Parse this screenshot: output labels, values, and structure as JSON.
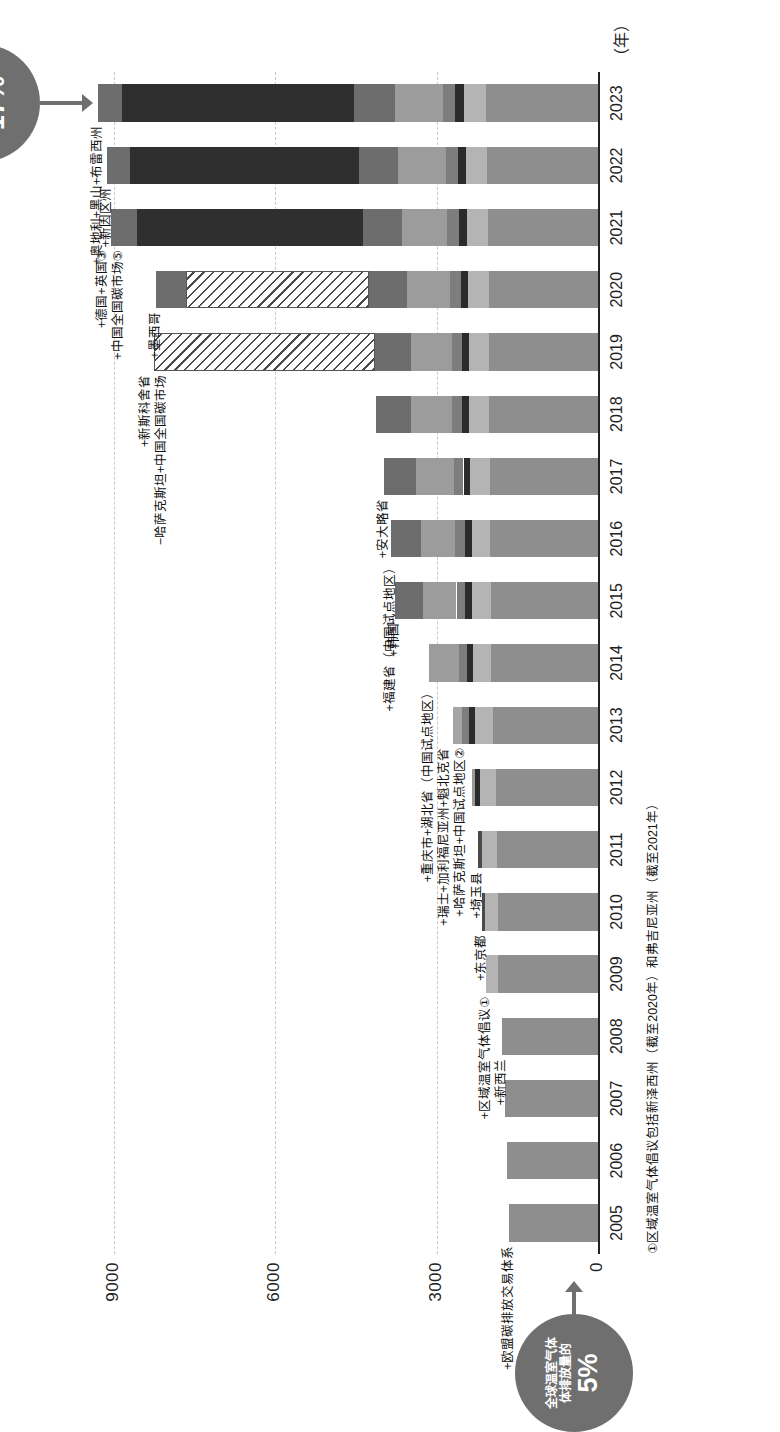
{
  "chart_data": {
    "type": "bar",
    "title": "",
    "xlabel": "（年）",
    "ylabel": "",
    "ylim": [
      0,
      10000
    ],
    "yticks": [
      "0",
      "3000",
      "6000",
      "9000"
    ],
    "grid": true,
    "legend": "none",
    "categories": [
      "2005",
      "2006",
      "2007",
      "2008",
      "2009",
      "2010",
      "2011",
      "2012",
      "2013",
      "2014",
      "2015",
      "2016",
      "2017",
      "2018",
      "2019",
      "2020",
      "2021",
      "2022",
      "2023"
    ],
    "stacks": [
      {
        "year": "2005",
        "segments": [
          {
            "value": 1650,
            "color": "#8e8e8e",
            "hatch": false
          }
        ]
      },
      {
        "year": "2006",
        "segments": [
          {
            "value": 1700,
            "color": "#8e8e8e",
            "hatch": false
          }
        ]
      },
      {
        "year": "2007",
        "segments": [
          {
            "value": 1720,
            "color": "#8e8e8e",
            "hatch": false
          }
        ]
      },
      {
        "year": "2008",
        "segments": [
          {
            "value": 1780,
            "color": "#8e8e8e",
            "hatch": false
          }
        ]
      },
      {
        "year": "2009",
        "segments": [
          {
            "value": 1850,
            "color": "#8e8e8e",
            "hatch": false
          },
          {
            "value": 230,
            "color": "#b4b4b4",
            "hatch": false
          }
        ]
      },
      {
        "year": "2010",
        "segments": [
          {
            "value": 1850,
            "color": "#8e8e8e",
            "hatch": false
          },
          {
            "value": 250,
            "color": "#b4b4b4",
            "hatch": false
          },
          {
            "value": 60,
            "color": "#4a4a4a",
            "hatch": false
          }
        ]
      },
      {
        "year": "2011",
        "segments": [
          {
            "value": 1880,
            "color": "#8e8e8e",
            "hatch": false
          },
          {
            "value": 280,
            "color": "#b4b4b4",
            "hatch": false
          },
          {
            "value": 70,
            "color": "#4a4a4a",
            "hatch": false
          }
        ]
      },
      {
        "year": "2012",
        "segments": [
          {
            "value": 1900,
            "color": "#8e8e8e",
            "hatch": false
          },
          {
            "value": 300,
            "color": "#b4b4b4",
            "hatch": false
          },
          {
            "value": 80,
            "color": "#2b2b2b",
            "hatch": false
          },
          {
            "value": 60,
            "color": "#9a9a9a",
            "hatch": false
          }
        ]
      },
      {
        "year": "2013",
        "segments": [
          {
            "value": 1950,
            "color": "#8e8e8e",
            "hatch": false
          },
          {
            "value": 330,
            "color": "#b4b4b4",
            "hatch": false
          },
          {
            "value": 110,
            "color": "#2b2b2b",
            "hatch": false
          },
          {
            "value": 140,
            "color": "#7d7d7d",
            "hatch": false
          },
          {
            "value": 160,
            "color": "#a5a5a5",
            "hatch": false
          }
        ]
      },
      {
        "year": "2014",
        "segments": [
          {
            "value": 1980,
            "color": "#8e8e8e",
            "hatch": false
          },
          {
            "value": 340,
            "color": "#b4b4b4",
            "hatch": false
          },
          {
            "value": 120,
            "color": "#2b2b2b",
            "hatch": false
          },
          {
            "value": 150,
            "color": "#7d7d7d",
            "hatch": false
          },
          {
            "value": 560,
            "color": "#9c9c9c",
            "hatch": false
          }
        ]
      },
      {
        "year": "2015",
        "segments": [
          {
            "value": 1990,
            "color": "#8e8e8e",
            "hatch": false
          },
          {
            "value": 350,
            "color": "#b4b4b4",
            "hatch": false
          },
          {
            "value": 130,
            "color": "#2b2b2b",
            "hatch": false
          },
          {
            "value": 160,
            "color": "#7d7d7d",
            "hatch": false
          },
          {
            "value": 620,
            "color": "#9c9c9c",
            "hatch": false
          },
          {
            "value": 520,
            "color": "#6d6d6d",
            "hatch": false
          }
        ]
      },
      {
        "year": "2016",
        "segments": [
          {
            "value": 2000,
            "color": "#8e8e8e",
            "hatch": false
          },
          {
            "value": 350,
            "color": "#b4b4b4",
            "hatch": false
          },
          {
            "value": 130,
            "color": "#2b2b2b",
            "hatch": false
          },
          {
            "value": 170,
            "color": "#7d7d7d",
            "hatch": false
          },
          {
            "value": 640,
            "color": "#9c9c9c",
            "hatch": false
          },
          {
            "value": 560,
            "color": "#6d6d6d",
            "hatch": false
          }
        ]
      },
      {
        "year": "2017",
        "segments": [
          {
            "value": 2010,
            "color": "#8e8e8e",
            "hatch": false
          },
          {
            "value": 360,
            "color": "#b4b4b4",
            "hatch": false
          },
          {
            "value": 130,
            "color": "#2b2b2b",
            "hatch": false
          },
          {
            "value": 180,
            "color": "#7d7d7d",
            "hatch": false
          },
          {
            "value": 700,
            "color": "#9c9c9c",
            "hatch": false
          },
          {
            "value": 600,
            "color": "#6d6d6d",
            "hatch": false
          }
        ]
      },
      {
        "year": "2018",
        "segments": [
          {
            "value": 2020,
            "color": "#8e8e8e",
            "hatch": false
          },
          {
            "value": 370,
            "color": "#b4b4b4",
            "hatch": false
          },
          {
            "value": 130,
            "color": "#2b2b2b",
            "hatch": false
          },
          {
            "value": 190,
            "color": "#7d7d7d",
            "hatch": false
          },
          {
            "value": 760,
            "color": "#9c9c9c",
            "hatch": false
          },
          {
            "value": 660,
            "color": "#6d6d6d",
            "hatch": false
          }
        ]
      },
      {
        "year": "2019",
        "segments": [
          {
            "value": 2020,
            "color": "#8e8e8e",
            "hatch": false
          },
          {
            "value": 370,
            "color": "#b4b4b4",
            "hatch": false
          },
          {
            "value": 130,
            "color": "#2b2b2b",
            "hatch": false
          },
          {
            "value": 190,
            "color": "#7d7d7d",
            "hatch": false
          },
          {
            "value": 760,
            "color": "#9c9c9c",
            "hatch": false
          },
          {
            "value": 680,
            "color": "#6d6d6d",
            "hatch": false
          },
          {
            "value": 4100,
            "color": "#ffffff",
            "hatch": true
          }
        ]
      },
      {
        "year": "2020",
        "segments": [
          {
            "value": 2030,
            "color": "#8e8e8e",
            "hatch": false
          },
          {
            "value": 380,
            "color": "#b4b4b4",
            "hatch": false
          },
          {
            "value": 140,
            "color": "#2b2b2b",
            "hatch": false
          },
          {
            "value": 200,
            "color": "#7d7d7d",
            "hatch": false
          },
          {
            "value": 800,
            "color": "#9c9c9c",
            "hatch": false
          },
          {
            "value": 700,
            "color": "#6d6d6d",
            "hatch": false
          },
          {
            "value": 3400,
            "color": "#ffffff",
            "hatch": true
          },
          {
            "value": 560,
            "color": "#6d6d6d",
            "hatch": false
          }
        ]
      },
      {
        "year": "2021",
        "segments": [
          {
            "value": 2050,
            "color": "#8e8e8e",
            "hatch": false
          },
          {
            "value": 390,
            "color": "#b4b4b4",
            "hatch": false
          },
          {
            "value": 150,
            "color": "#2b2b2b",
            "hatch": false
          },
          {
            "value": 210,
            "color": "#7d7d7d",
            "hatch": false
          },
          {
            "value": 850,
            "color": "#9c9c9c",
            "hatch": false
          },
          {
            "value": 720,
            "color": "#6d6d6d",
            "hatch": false
          },
          {
            "value": 4200,
            "color": "#2f2f2f",
            "hatch": false
          },
          {
            "value": 480,
            "color": "#6d6d6d",
            "hatch": false
          }
        ]
      },
      {
        "year": "2022",
        "segments": [
          {
            "value": 2060,
            "color": "#8e8e8e",
            "hatch": false
          },
          {
            "value": 400,
            "color": "#b4b4b4",
            "hatch": false
          },
          {
            "value": 150,
            "color": "#2b2b2b",
            "hatch": false
          },
          {
            "value": 220,
            "color": "#7d7d7d",
            "hatch": false
          },
          {
            "value": 880,
            "color": "#9c9c9c",
            "hatch": false
          },
          {
            "value": 740,
            "color": "#6d6d6d",
            "hatch": false
          },
          {
            "value": 4250,
            "color": "#2f2f2f",
            "hatch": false
          },
          {
            "value": 420,
            "color": "#6d6d6d",
            "hatch": false
          }
        ]
      },
      {
        "year": "2023",
        "segments": [
          {
            "value": 2080,
            "color": "#8e8e8e",
            "hatch": false
          },
          {
            "value": 410,
            "color": "#b4b4b4",
            "hatch": false
          },
          {
            "value": 160,
            "color": "#2b2b2b",
            "hatch": false
          },
          {
            "value": 230,
            "color": "#7d7d7d",
            "hatch": false
          },
          {
            "value": 900,
            "color": "#9c9c9c",
            "hatch": false
          },
          {
            "value": 760,
            "color": "#6d6d6d",
            "hatch": false
          },
          {
            "value": 4300,
            "color": "#2f2f2f",
            "hatch": false
          },
          {
            "value": 450,
            "color": "#6d6d6d",
            "hatch": false
          }
        ]
      }
    ],
    "annotations": [
      {
        "year": "2005",
        "lines": [
          "+欧盟碳排放交易体系"
        ]
      },
      {
        "year": "2008",
        "lines": [
          "+新西兰"
        ]
      },
      {
        "year": "2009",
        "lines": [
          "+区域温室气体倡议①"
        ]
      },
      {
        "year": "2010",
        "lines": [
          "+东京都"
        ]
      },
      {
        "year": "2011",
        "lines": [
          "+埼玉县"
        ]
      },
      {
        "year": "2013",
        "lines": [
          "+瑞士+加利福尼亚州+魁北克省",
          "+哈萨克斯坦+中国试点地区②"
        ]
      },
      {
        "year": "2014",
        "lines": [
          "+重庆市+湖北省（中国试点地区）"
        ]
      },
      {
        "year": "2015",
        "lines": [
          "+韩国"
        ]
      },
      {
        "year": "2016",
        "lines": [
          "+福建省（中国试点地区）"
        ]
      },
      {
        "year": "2017",
        "lines": [
          "+安大略省"
        ]
      },
      {
        "year": "2019",
        "lines": [
          "+新斯科舍省",
          "−哈萨克斯坦+中国全国碳市场"
        ]
      },
      {
        "year": "2020",
        "lines": [
          "+墨西哥"
        ]
      },
      {
        "year": "2021",
        "lines": [
          "+德国+英国③",
          "+中国全国碳市场⑤"
        ]
      },
      {
        "year": "2022",
        "lines": [
          "+新因区州"
        ]
      },
      {
        "year": "2023",
        "lines": [
          "+奥地利+黑山+布雷西州"
        ]
      }
    ],
    "callouts": [
      {
        "id": "callout-5pct",
        "label_lines": [
          "全球温室气体",
          "体排放量的"
        ],
        "percent": "5%",
        "target_year": "2005"
      },
      {
        "id": "callout-17pct",
        "label_lines": [
          "全球温室气体",
          "体排放量的"
        ],
        "percent": "17%",
        "target_year": "2023"
      }
    ],
    "footnotes": [
      "①区域温室气体倡议包括新泽西州（截至2020年）和弗吉尼亚州（截至2021年）"
    ]
  }
}
